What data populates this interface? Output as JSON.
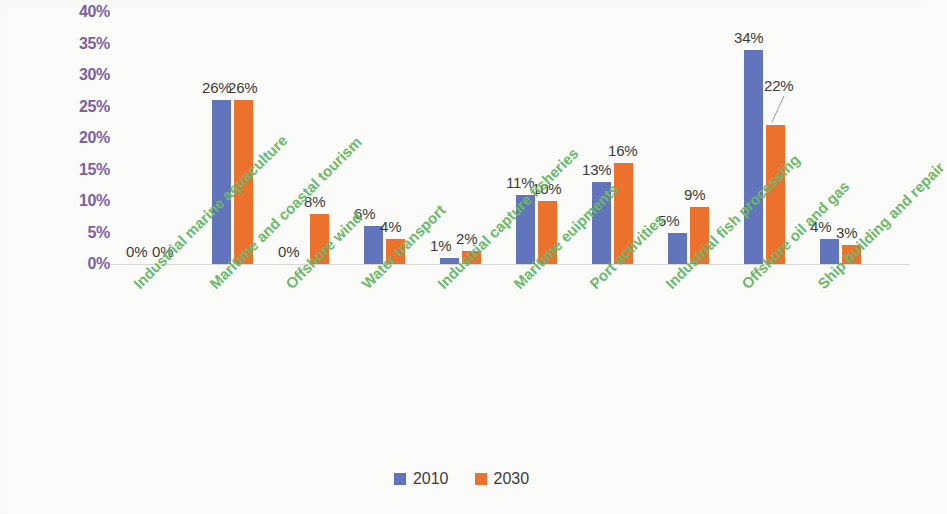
{
  "chart_data": {
    "type": "bar",
    "title": "",
    "subtitle": "",
    "xlabel": "",
    "ylabel": "",
    "ylim": [
      0,
      40
    ],
    "ytick_values": [
      0,
      5,
      10,
      15,
      20,
      25,
      30,
      35,
      40
    ],
    "ytick_labels": [
      "0%",
      "5%",
      "10%",
      "15%",
      "20%",
      "25%",
      "30%",
      "35%",
      "40%"
    ],
    "grid": false,
    "legend_position": "bottom",
    "value_suffix": "%",
    "categories": [
      "Industrial marine aquaculture",
      "Maritime and coastal tourism",
      "Offshore wind",
      "Water transport",
      "Industrial capture fisheries",
      "Maritime euipments",
      "Port activities",
      "Industrial fish processing",
      "Offshore oil and gas",
      "Ship building and repair"
    ],
    "series": [
      {
        "name": "2010",
        "color": "#6274bb",
        "values": [
          0,
          26,
          0,
          6,
          1,
          11,
          13,
          5,
          34,
          4
        ],
        "labels": [
          "0%",
          "26%",
          "0%",
          "6%",
          "1%",
          "11%",
          "13%",
          "5%",
          "34%",
          "4%"
        ]
      },
      {
        "name": "2030",
        "color": "#ec712d",
        "values": [
          0,
          26,
          8,
          4,
          2,
          10,
          16,
          9,
          22,
          3
        ],
        "labels": [
          "0%",
          "26%",
          "8%",
          "4%",
          "2%",
          "10%",
          "16%",
          "9%",
          "22%",
          "3%"
        ]
      }
    ],
    "annotations": [
      {
        "text": "22%",
        "series": "2030",
        "category": "Offshore oil and gas",
        "leader_line": true
      }
    ],
    "axis_label_color": "#7d5fa3",
    "category_label_color": "#6bb96b",
    "data_label_color": "#3b3b3b"
  },
  "legend": {
    "items": [
      {
        "label": "2010",
        "color": "#6274bb"
      },
      {
        "label": "2030",
        "color": "#ec712d"
      }
    ]
  }
}
